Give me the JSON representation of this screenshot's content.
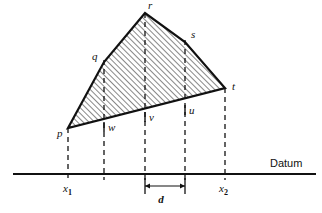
{
  "figure": {
    "kind": "engineering-cross-section-diagram",
    "background_color": "#ffffff",
    "ink_color": "#111111",
    "hatch_color": "#1a1a1a",
    "width": 322,
    "height": 213
  },
  "datum": {
    "label": "Datum",
    "line_y": 174,
    "line_x_start": 13,
    "line_x_end": 316,
    "label_x": 270,
    "label_y": 167
  },
  "polygon": {
    "fill": "none",
    "outline_color": "#111111",
    "outline_width": 2.2,
    "hatch_angle_deg": 45,
    "hatch_spacing_px": 4,
    "vertices": [
      {
        "id": "p",
        "label": "p",
        "x": 68,
        "y": 128,
        "label_x": 57,
        "label_y": 137,
        "on_dashed": true
      },
      {
        "id": "q",
        "label": "q",
        "x": 104,
        "y": 62,
        "label_x": 92,
        "label_y": 60,
        "on_dashed": true
      },
      {
        "id": "r",
        "label": "r",
        "x": 145,
        "y": 13,
        "label_x": 148,
        "label_y": 9,
        "on_dashed": true
      },
      {
        "id": "s",
        "label": "s",
        "x": 185,
        "y": 42,
        "label_x": 191,
        "label_y": 38,
        "on_dashed": true
      },
      {
        "id": "t",
        "label": "t",
        "x": 225,
        "y": 88,
        "label_x": 232,
        "label_y": 90,
        "on_dashed": true
      },
      {
        "id": "u",
        "label": "u",
        "x": 185,
        "y": 98,
        "label_x": 189,
        "label_y": 114,
        "on_dashed": true
      },
      {
        "id": "v",
        "label": "v",
        "x": 145,
        "y": 108,
        "label_x": 149,
        "label_y": 121,
        "on_dashed": true
      },
      {
        "id": "w",
        "label": "w",
        "x": 104,
        "y": 118,
        "label_x": 108,
        "label_y": 131,
        "on_dashed": true
      }
    ]
  },
  "dashed_lines": [
    {
      "name": "dashed-x1",
      "x": 68,
      "y_top": 128,
      "y_bottom": 180
    },
    {
      "name": "dashed-w",
      "x": 104,
      "y_top": 60,
      "y_bottom": 180
    },
    {
      "name": "dashed-v",
      "x": 145,
      "y_top": 13,
      "y_bottom": 180
    },
    {
      "name": "dashed-u",
      "x": 185,
      "y_top": 40,
      "y_bottom": 180
    },
    {
      "name": "dashed-x2",
      "x": 225,
      "y_top": 88,
      "y_bottom": 180
    }
  ],
  "station_labels": [
    {
      "id": "x1",
      "base": "x",
      "sub": "1",
      "x": 63,
      "y": 192
    },
    {
      "id": "x2",
      "base": "x",
      "sub": "2",
      "x": 219,
      "y": 192
    }
  ],
  "dimension": {
    "label": "d",
    "x_start": 145,
    "x_end": 185,
    "line_y": 186,
    "tick_top": 178,
    "tick_bottom": 194,
    "label_x": 161,
    "label_y": 203
  }
}
